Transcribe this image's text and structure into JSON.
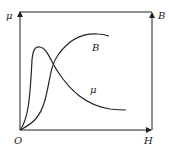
{
  "diagram": {
    "title": "",
    "type": "magnetization curve (B-H) and permeability (μ-H)",
    "axes": {
      "left_label": "μ",
      "right_label": "B",
      "bottom_label": "H",
      "origin_label": "O"
    },
    "curves": [
      {
        "name": "B",
        "label": "B",
        "description": "magnetization curve rising and saturating"
      },
      {
        "name": "mu",
        "label": "μ",
        "description": "permeability peaking then decreasing"
      }
    ],
    "colors": {
      "line": "#222222",
      "background": "#ffffff"
    }
  }
}
